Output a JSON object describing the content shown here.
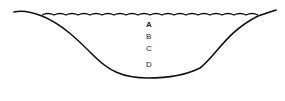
{
  "diagram": {
    "type": "lake-cross-section",
    "labels": [
      {
        "id": "A",
        "text": "A",
        "x": 148,
        "y": 21
      },
      {
        "id": "B",
        "text": "B",
        "x": 148,
        "y": 33
      },
      {
        "id": "C",
        "text": "C",
        "x": 148,
        "y": 45
      },
      {
        "id": "D",
        "text": "D",
        "x": 148,
        "y": 61
      }
    ],
    "colors": {
      "stroke": "#111111",
      "background": "#ffffff"
    }
  }
}
